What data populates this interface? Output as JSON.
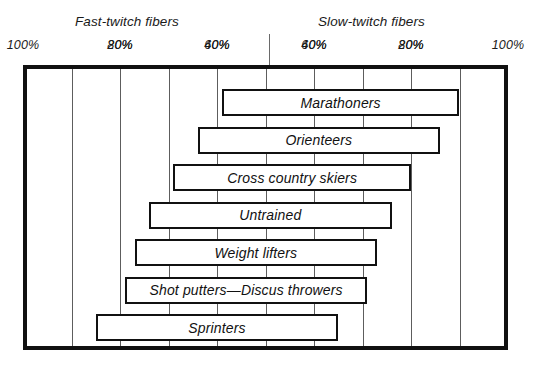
{
  "figure": {
    "left_group_title": "Fast-twitch fibers",
    "right_group_title": "Slow-twitch fibers"
  },
  "axis": {
    "left_ticks": [
      "100%",
      "80%",
      "60%",
      "40%",
      "20%"
    ],
    "right_ticks": [
      "20%",
      "40%",
      "60%",
      "80%",
      "100%"
    ]
  },
  "chart_data": {
    "type": "bar",
    "orientation": "horizontal",
    "subtype": "range-bar",
    "title": "",
    "subtitle": "",
    "xlabel": "",
    "ylabel": "",
    "xlim": [
      0,
      100
    ],
    "x_axis_description": "Percent muscle fiber composition; left half labeled Fast-twitch fibers counting 100% down to 20%, right half labeled Slow-twitch fibers counting 20% up to 100%. Values below are percent slow-twitch fibers.",
    "x_tick_values_slow_twitch": [
      0,
      20,
      40,
      60,
      80,
      100
    ],
    "x_tick_labels_left": [
      "100%",
      "80%",
      "60%",
      "40%",
      "20%"
    ],
    "x_tick_labels_right": [
      "20%",
      "40%",
      "60%",
      "80%",
      "100%"
    ],
    "grid": true,
    "legend": "none",
    "categories": [
      "Marathoners",
      "Orienteers",
      "Cross country skiers",
      "Untrained",
      "Weight lifters",
      "Shot putters—Discus throwers",
      "Sprinters"
    ],
    "series": [
      {
        "name": "Slow-twitch fiber range (%)",
        "ranges": [
          {
            "category": "Marathoners",
            "low": 41,
            "high": 90
          },
          {
            "category": "Orienteers",
            "low": 36,
            "high": 86
          },
          {
            "category": "Cross country skiers",
            "low": 31,
            "high": 80
          },
          {
            "category": "Untrained",
            "low": 26,
            "high": 76
          },
          {
            "category": "Weight lifters",
            "low": 23,
            "high": 73
          },
          {
            "category": "Shot putters—Discus throwers",
            "low": 21,
            "high": 71
          },
          {
            "category": "Sprinters",
            "low": 15,
            "high": 65
          }
        ]
      }
    ],
    "bars": [
      {
        "label": "Marathoners",
        "slow_low": 41,
        "slow_high": 90,
        "fast_low": 10,
        "fast_high": 59
      },
      {
        "label": "Orienteers",
        "slow_low": 36,
        "slow_high": 86,
        "fast_low": 14,
        "fast_high": 64
      },
      {
        "label": "Cross country skiers",
        "slow_low": 31,
        "slow_high": 80,
        "fast_low": 20,
        "fast_high": 69
      },
      {
        "label": "Untrained",
        "slow_low": 26,
        "slow_high": 76,
        "fast_low": 24,
        "fast_high": 74
      },
      {
        "label": "Weight lifters",
        "slow_low": 23,
        "slow_high": 73,
        "fast_low": 27,
        "fast_high": 77
      },
      {
        "label": "Shot putters—Discus throwers",
        "slow_low": 21,
        "slow_high": 71,
        "fast_low": 29,
        "fast_high": 79
      },
      {
        "label": "Sprinters",
        "slow_low": 15,
        "slow_high": 65,
        "fast_low": 35,
        "fast_high": 85
      }
    ]
  },
  "colors": {
    "frame": "#111111",
    "gridline": "#5d5d5d",
    "bar_border": "#111111",
    "bar_fill": "#ffffff",
    "text": "#1a1a1a",
    "background": "#ffffff"
  }
}
